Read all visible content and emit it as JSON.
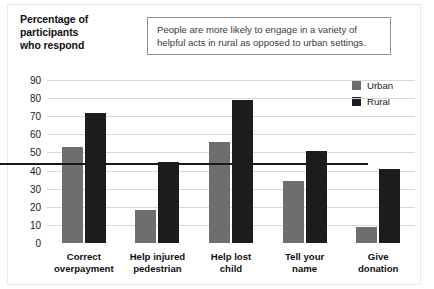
{
  "axis_title": "Percentage of\nparticipants\nwho respond",
  "callout": {
    "text": "People are more likely to engage in a variety of helpful acts in rural as opposed to urban settings."
  },
  "legend": {
    "position": "top-right",
    "entries": [
      {
        "label": "Urban",
        "color": "#6e6e6e",
        "swatch_name": "legend-swatch-urban"
      },
      {
        "label": "Rural",
        "color": "#1c1c1c",
        "swatch_name": "legend-swatch-rural"
      }
    ]
  },
  "chart_data": {
    "type": "bar",
    "xlabel": "",
    "ylabel": "Percentage of participants who respond",
    "ylim": [
      0,
      90
    ],
    "yticks": [
      0,
      10,
      20,
      30,
      40,
      50,
      60,
      70,
      80,
      90
    ],
    "grid": true,
    "categories": [
      "Correct overpayment",
      "Help injured pedestrian",
      "Help lost child",
      "Tell your name",
      "Give donation"
    ],
    "category_lines": [
      [
        "Correct",
        "overpayment"
      ],
      [
        "Help injured",
        "pedestrian"
      ],
      [
        "Help lost",
        "child"
      ],
      [
        "Tell your",
        "name"
      ],
      [
        "Give",
        "donation"
      ]
    ],
    "series": [
      {
        "name": "Urban",
        "color": "#6e6e6e",
        "values": [
          53,
          18,
          56,
          34,
          9
        ]
      },
      {
        "name": "Rural",
        "color": "#1c1c1c",
        "values": [
          72,
          45,
          79,
          51,
          41
        ]
      }
    ]
  }
}
